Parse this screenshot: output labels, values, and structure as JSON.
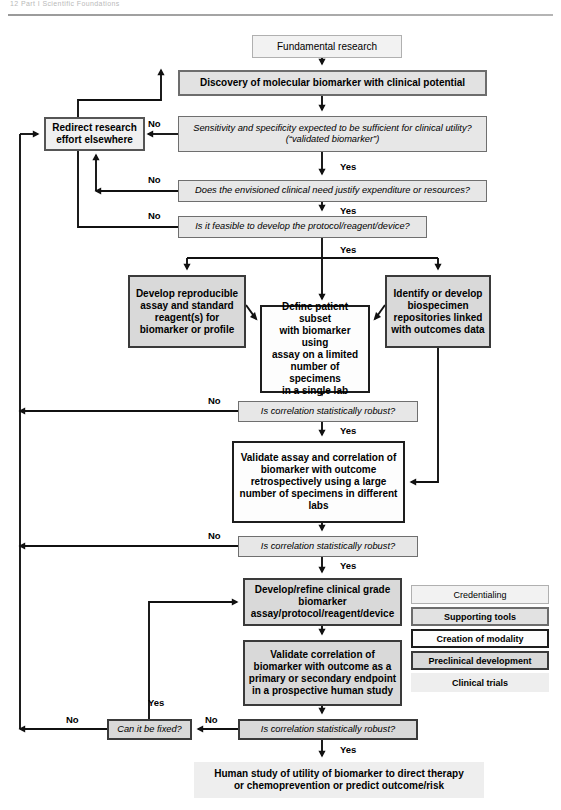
{
  "header": {
    "text": "12  Part I  Scientific Foundations"
  },
  "legend": {
    "name": "category-legend",
    "x": 411,
    "y": 585,
    "width": 138,
    "items": [
      {
        "label": "Credentialing",
        "style": "cat-credentialing",
        "key": "credentialing"
      },
      {
        "label": "Supporting tools",
        "style": "cat-supporting",
        "key": "supporting"
      },
      {
        "label": "Creation of modality",
        "style": "cat-modality",
        "key": "modality"
      },
      {
        "label": "Preclinical development",
        "style": "cat-preclinical",
        "key": "preclinical"
      },
      {
        "label": "Clinical trials",
        "style": "cat-clinical",
        "key": "clinical"
      }
    ]
  },
  "colors": {
    "credentialing_fill": "#f2f2f2",
    "supporting_fill": "#e2e2e2",
    "modality_fill": "#fdfdfd",
    "preclinical_fill": "#d9d9d9",
    "clinical_fill": "#eeeeee",
    "line": "#111111"
  },
  "nodes": [
    {
      "id": "fundamental",
      "name": "node-fundamental-research",
      "text": "Fundamental research",
      "style": "cat-credentialing",
      "x": 252,
      "y": 35,
      "w": 150,
      "h": 23,
      "fs": 10
    },
    {
      "id": "discovery",
      "name": "node-discovery-biomarker",
      "text": "Discovery of molecular biomarker with clinical potential",
      "style": "cat-supporting",
      "x": 178,
      "y": 70,
      "w": 309,
      "h": 26,
      "fs": 10
    },
    {
      "id": "redirect",
      "name": "node-redirect-research",
      "text": "Redirect research\neffort elsewhere",
      "style": "cat-redirect",
      "x": 44,
      "y": 117,
      "w": 101,
      "h": 34,
      "fs": 10
    },
    {
      "id": "sensitivity",
      "name": "decision-sensitivity-specificity",
      "text": "Sensitivity and specificity expected to be sufficient for clinical utility?\n(“validated biomarker”)",
      "style": "cat-decision",
      "x": 178,
      "y": 116,
      "w": 309,
      "h": 36,
      "fs": 9.3
    },
    {
      "id": "need",
      "name": "decision-clinical-need",
      "text": "Does the envisioned clinical need justify expenditure or resources?",
      "style": "cat-decision",
      "x": 178,
      "y": 180,
      "w": 309,
      "h": 22,
      "fs": 9.3
    },
    {
      "id": "feasible",
      "name": "decision-feasible-protocol",
      "text": "Is it feasible to develop the protocol/reagent/device?",
      "style": "cat-decision",
      "x": 178,
      "y": 216,
      "w": 249,
      "h": 22,
      "fs": 9.3
    },
    {
      "id": "develop_assay",
      "name": "node-develop-reproducible-assay",
      "text": "Develop reproducible\nassay and standard\nreagent(s) for\nbiomarker or profile",
      "style": "cat-preclinical",
      "x": 128,
      "y": 275,
      "w": 118,
      "h": 73,
      "fs": 10
    },
    {
      "id": "define_subset",
      "name": "node-define-patient-subset",
      "text": "Define patient subset\nwith biomarker using\nassay on a limited\nnumber of specimens\nin a single lab",
      "style": "cat-modality",
      "x": 260,
      "y": 305,
      "w": 110,
      "h": 88,
      "fs": 10
    },
    {
      "id": "biospecimen",
      "name": "node-biospecimen-repositories",
      "text": "Identify or develop\nbiospecimen\nrepositories linked\nwith outcomes data",
      "style": "cat-preclinical",
      "x": 385,
      "y": 275,
      "w": 106,
      "h": 73,
      "fs": 10
    },
    {
      "id": "corr1",
      "name": "decision-correlation-robust-1",
      "text": "Is correlation statistically robust?",
      "style": "cat-decision",
      "x": 238,
      "y": 401,
      "w": 180,
      "h": 21,
      "fs": 9.3
    },
    {
      "id": "validate_retro",
      "name": "node-validate-assay-retrospective",
      "text": "Validate assay and correlation of\nbiomarker with outcome\nretrospectively using a large\nnumber of specimens in different\nlabs",
      "style": "cat-modality",
      "x": 232,
      "y": 441,
      "w": 173,
      "h": 82,
      "fs": 10
    },
    {
      "id": "corr2",
      "name": "decision-correlation-robust-2",
      "text": "Is correlation statistically robust?",
      "style": "cat-decision",
      "x": 238,
      "y": 536,
      "w": 180,
      "h": 21,
      "fs": 9.3
    },
    {
      "id": "refine",
      "name": "node-develop-refine-clinical-grade",
      "text": "Develop/refine clinical grade\nbiomarker\nassay/protocol/reagent/device",
      "style": "cat-preclinical",
      "x": 243,
      "y": 578,
      "w": 159,
      "h": 48,
      "fs": 10
    },
    {
      "id": "validate_pro",
      "name": "node-validate-correlation-prospective",
      "text": "Validate correlation of\nbiomarker with outcome as a\nprimary or secondary endpoint\nin a prospective human study",
      "style": "cat-preclinical",
      "x": 243,
      "y": 640,
      "w": 159,
      "h": 66,
      "fs": 10
    },
    {
      "id": "fixed",
      "name": "decision-can-it-be-fixed",
      "text": "Can it be fixed?",
      "style": "cat-decision-dk",
      "x": 107,
      "y": 719,
      "w": 85,
      "h": 21,
      "fs": 9.3
    },
    {
      "id": "corr3",
      "name": "decision-correlation-robust-3",
      "text": "Is correlation statistically robust?",
      "style": "cat-decision-dk",
      "x": 238,
      "y": 719,
      "w": 180,
      "h": 21,
      "fs": 9.3
    },
    {
      "id": "human_study",
      "name": "node-human-study-utility",
      "text": "Human study of utility of biomarker to direct therapy\nor chemoprevention or predict outcome/risk",
      "style": "cat-clinical",
      "x": 194,
      "y": 762,
      "w": 290,
      "h": 36,
      "fs": 10
    }
  ],
  "edge_labels": [
    {
      "name": "edge-label-no-sensitivity",
      "text": "No",
      "x": 148,
      "y": 118
    },
    {
      "name": "edge-label-yes-sensitivity",
      "text": "Yes",
      "x": 340,
      "y": 161
    },
    {
      "name": "edge-label-no-need",
      "text": "No",
      "x": 148,
      "y": 174
    },
    {
      "name": "edge-label-yes-need",
      "text": "Yes",
      "x": 340,
      "y": 205
    },
    {
      "name": "edge-label-no-feasible",
      "text": "No",
      "x": 148,
      "y": 210
    },
    {
      "name": "edge-label-yes-feasible",
      "text": "Yes",
      "x": 340,
      "y": 244
    },
    {
      "name": "edge-label-no-corr1",
      "text": "No",
      "x": 208,
      "y": 395
    },
    {
      "name": "edge-label-yes-corr1",
      "text": "Yes",
      "x": 340,
      "y": 425
    },
    {
      "name": "edge-label-no-corr2",
      "text": "No",
      "x": 208,
      "y": 530
    },
    {
      "name": "edge-label-yes-corr2",
      "text": "Yes",
      "x": 340,
      "y": 560
    },
    {
      "name": "edge-label-no-corr3",
      "text": "No",
      "x": 205,
      "y": 714
    },
    {
      "name": "edge-label-yes-corr3",
      "text": "Yes",
      "x": 340,
      "y": 744
    },
    {
      "name": "edge-label-no-fixed",
      "text": "No",
      "x": 66,
      "y": 714
    },
    {
      "name": "edge-label-yes-fixed",
      "text": "Yes",
      "x": 148,
      "y": 697
    }
  ],
  "edges": [
    {
      "name": "edge-fundamental-to-discovery",
      "d": "M322,58 L322,64",
      "arrow": "down"
    },
    {
      "name": "edge-discovery-to-sensitivity",
      "d": "M322,96 L322,110",
      "arrow": "down"
    },
    {
      "name": "edge-sensitivity-no-redirect",
      "d": "M178,134 L148,134",
      "arrow": "left"
    },
    {
      "name": "edge-sensitivity-yes-need",
      "d": "M322,152 L322,174",
      "arrow": "down"
    },
    {
      "name": "edge-need-no-left",
      "d": "M178,191 L96,191",
      "arrow": "left"
    },
    {
      "name": "edge-need-no-up-redirect",
      "d": "M96,191 L96,155",
      "arrow": "up"
    },
    {
      "name": "edge-need-yes-feasible",
      "d": "M322,202 L322,210",
      "arrow": "down"
    },
    {
      "name": "edge-feasible-no-left-up",
      "d": "M178,227 L78,227 L78,100 L161,100 L161,70",
      "arrow": "up"
    },
    {
      "name": "edge-feasible-yes-split",
      "d": "M322,238 L322,258",
      "arrow": "none"
    },
    {
      "name": "edge-split-bus",
      "d": "M187,258 L438,258",
      "arrow": "none"
    },
    {
      "name": "edge-bus-to-develop-assay",
      "d": "M187,258 L187,269",
      "arrow": "down"
    },
    {
      "name": "edge-bus-to-define-subset",
      "d": "M322,258 L322,299",
      "arrow": "down"
    },
    {
      "name": "edge-bus-to-biospecimen",
      "d": "M438,258 L438,269",
      "arrow": "down"
    },
    {
      "name": "edge-develop-to-define",
      "d": "M246,305 L256,319",
      "arrow": "diag-dr"
    },
    {
      "name": "edge-biospecimen-to-define",
      "d": "M385,305 L375,319",
      "arrow": "diag-dl"
    },
    {
      "name": "edge-define-to-corr1",
      "d": "M322,393 L322,395",
      "arrow": "down"
    },
    {
      "name": "edge-corr1-no-left",
      "d": "M238,411 L20,411",
      "arrow": "left"
    },
    {
      "name": "edge-corr1-yes-validate",
      "d": "M322,422 L322,435",
      "arrow": "down"
    },
    {
      "name": "edge-biospecimen-to-validate",
      "d": "M438,348 L438,482 L411,482",
      "arrow": "left"
    },
    {
      "name": "edge-validate-to-corr2",
      "d": "M322,523 L322,530",
      "arrow": "down"
    },
    {
      "name": "edge-corr2-no-left",
      "d": "M238,546 L20,546",
      "arrow": "left"
    },
    {
      "name": "edge-corr2-yes-refine",
      "d": "M322,557 L322,572",
      "arrow": "down"
    },
    {
      "name": "edge-refine-to-validate-pro",
      "d": "M322,626 L322,634",
      "arrow": "down"
    },
    {
      "name": "edge-validatepro-to-corr3",
      "d": "M322,706 L322,713",
      "arrow": "down"
    },
    {
      "name": "edge-corr3-no-fixed",
      "d": "M238,729 L198,729",
      "arrow": "left"
    },
    {
      "name": "edge-corr3-yes-human",
      "d": "M322,740 L322,756",
      "arrow": "down"
    },
    {
      "name": "edge-fixed-no-left",
      "d": "M107,729 L20,729",
      "arrow": "left"
    },
    {
      "name": "edge-fixed-yes-up-refine",
      "d": "M149,719 L149,602 L237,602",
      "arrow": "right"
    },
    {
      "name": "edge-left-rail",
      "d": "M20,729 L20,134",
      "arrow": "none"
    },
    {
      "name": "edge-left-rail-into-redirect",
      "d": "M20,134 L38,134",
      "arrow": "right"
    }
  ]
}
